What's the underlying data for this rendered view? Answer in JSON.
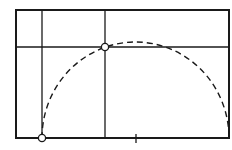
{
  "diagram": {
    "colors": {
      "stroke": "#1a1a1a",
      "background": "#ffffff",
      "point_fill": "#ffffff"
    },
    "frame": {
      "x1": 16,
      "y1": 10,
      "x2": 229,
      "y2": 138
    },
    "vertical_lines": [
      42,
      105
    ],
    "horizontal_lines": [
      47
    ],
    "arc": {
      "cx": 135.5,
      "cy": 138,
      "rx": 93.5,
      "ry": 96,
      "style": "dashed"
    },
    "points": [
      {
        "name": "start-point",
        "x": 42,
        "y": 138
      },
      {
        "name": "intersection-point",
        "x": 105,
        "y": 47
      }
    ],
    "tick": {
      "x": 136,
      "y1": 134,
      "y2": 143
    }
  }
}
